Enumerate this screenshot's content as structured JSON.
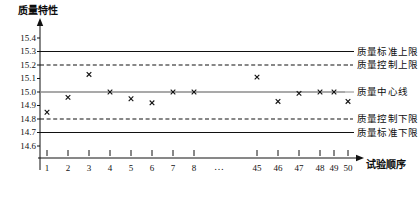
{
  "chart_data": {
    "type": "scatter",
    "title": "",
    "ylabel": "质量特性",
    "xlabel": "试验顺序",
    "ylim": [
      14.55,
      15.45
    ],
    "yticks": [
      "15.4",
      "15.3",
      "15.2",
      "15.1",
      "15.0",
      "14.9",
      "14.8",
      "14.7",
      "14.6"
    ],
    "ytick_values": [
      15.4,
      15.3,
      15.2,
      15.1,
      15.0,
      14.9,
      14.8,
      14.7,
      14.6
    ],
    "xticks": [
      "1",
      "2",
      "3",
      "4",
      "5",
      "6",
      "7",
      "8",
      "45",
      "46",
      "47",
      "48",
      "49",
      "50"
    ],
    "xtick_break": "…",
    "grid": false,
    "legend_position": "right",
    "marker": "x",
    "series": [
      {
        "name": "质量特性测量值",
        "x": [
          1,
          2,
          3,
          4,
          5,
          6,
          7,
          8,
          45,
          46,
          47,
          48,
          49,
          50
        ],
        "values": [
          14.85,
          14.96,
          15.13,
          15.0,
          14.95,
          14.92,
          15.0,
          15.0,
          15.11,
          14.93,
          14.99,
          15.0,
          15.0,
          14.93
        ]
      }
    ],
    "reference_lines": [
      {
        "key": "usl",
        "label": "质量标准上限",
        "value": 15.3,
        "style": "solid",
        "color": "#111111"
      },
      {
        "key": "ucl",
        "label": "质量控制上限",
        "value": 15.2,
        "style": "dashed",
        "color": "#111111"
      },
      {
        "key": "cl",
        "label": "质量中心线",
        "value": 15.0,
        "style": "solid",
        "color": "#8c8c8c"
      },
      {
        "key": "lcl",
        "label": "质量控制下限",
        "value": 14.8,
        "style": "dashed",
        "color": "#111111"
      },
      {
        "key": "lsl",
        "label": "质量标准下限",
        "value": 14.7,
        "style": "solid",
        "color": "#111111"
      }
    ]
  }
}
